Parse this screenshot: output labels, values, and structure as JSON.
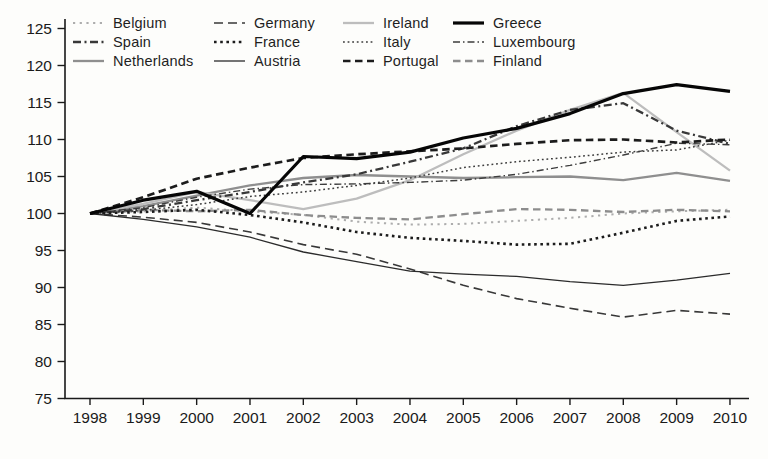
{
  "page": {
    "background": "#fdfdfb",
    "text_color": "#1a1a1a",
    "axis_color": "#1a1a1a"
  },
  "chart_data": {
    "type": "line",
    "title": "",
    "xlabel": "",
    "ylabel": "",
    "x": [
      1998,
      1999,
      2000,
      2001,
      2002,
      2003,
      2004,
      2005,
      2006,
      2007,
      2008,
      2009,
      2010
    ],
    "ylim": [
      75,
      125
    ],
    "yticks": [
      75,
      80,
      85,
      90,
      95,
      100,
      105,
      110,
      115,
      120,
      125
    ],
    "grid": false,
    "legend_position": "top-left inside plot, 4 columns x 3 rows",
    "index_note": "all series start at 100 in 1998",
    "series": [
      {
        "name": "Belgium",
        "color": "#adadad",
        "dasharray": "2.2 4.5",
        "width": 2.0,
        "values": [
          100,
          100.3,
          100.8,
          100.3,
          99.8,
          98.9,
          98.5,
          98.6,
          99.0,
          99.4,
          100.0,
          100.3,
          100.5
        ]
      },
      {
        "name": "Spain",
        "color": "#383838",
        "dasharray": "8 3.5 2 3.5",
        "width": 2.3,
        "values": [
          100,
          100.6,
          101.8,
          102.9,
          104.2,
          105.3,
          107.0,
          108.8,
          111.8,
          114.0,
          114.9,
          111.2,
          109.4
        ]
      },
      {
        "name": "Netherlands",
        "color": "#8f8f8f",
        "dasharray": "",
        "width": 2.3,
        "values": [
          100,
          101.0,
          102.4,
          103.8,
          104.8,
          105.2,
          105.0,
          104.8,
          104.9,
          105.0,
          104.5,
          105.5,
          104.4
        ]
      },
      {
        "name": "Germany",
        "color": "#383838",
        "dasharray": "9 5",
        "width": 1.6,
        "values": [
          100,
          99.5,
          98.8,
          97.5,
          95.8,
          94.5,
          92.5,
          90.3,
          88.5,
          87.2,
          86.0,
          86.9,
          86.4
        ]
      },
      {
        "name": "France",
        "color": "#1c1c1c",
        "dasharray": "2.6 3.6",
        "width": 2.6,
        "values": [
          100,
          100.2,
          100.5,
          99.8,
          98.8,
          97.5,
          96.7,
          96.3,
          95.8,
          95.9,
          97.4,
          99.0,
          99.6
        ]
      },
      {
        "name": "Austria",
        "color": "#2b2b2b",
        "dasharray": "",
        "width": 1.3,
        "values": [
          100,
          99.2,
          98.2,
          96.8,
          94.8,
          93.5,
          92.2,
          91.8,
          91.5,
          90.8,
          90.3,
          91.0,
          91.9
        ]
      },
      {
        "name": "Ireland",
        "color": "#bdbdbd",
        "dasharray": "",
        "width": 2.3,
        "values": [
          100,
          101.3,
          102.9,
          101.8,
          100.6,
          102.0,
          104.5,
          108.0,
          111.2,
          114.0,
          116.3,
          111.0,
          105.8
        ]
      },
      {
        "name": "Italy",
        "color": "#3d3d3d",
        "dasharray": "1.8 2.8",
        "width": 1.5,
        "values": [
          100,
          100.4,
          101.2,
          102.3,
          102.9,
          103.8,
          104.8,
          106.2,
          107.0,
          107.6,
          108.3,
          108.6,
          109.9
        ]
      },
      {
        "name": "Portugal",
        "color": "#1c1c1c",
        "dasharray": "7.5 4.5",
        "width": 2.7,
        "values": [
          100,
          102.2,
          104.7,
          106.2,
          107.5,
          108.0,
          108.4,
          108.8,
          109.4,
          109.9,
          110.0,
          109.6,
          110.0
        ]
      },
      {
        "name": "Greece",
        "color": "#060606",
        "dasharray": "",
        "width": 3.2,
        "values": [
          100,
          101.8,
          103.0,
          100.0,
          107.7,
          107.4,
          108.3,
          110.2,
          111.5,
          113.5,
          116.2,
          117.4,
          116.5
        ]
      },
      {
        "name": "Luxembourg",
        "color": "#3d3d3d",
        "dasharray": "7 3 1.5 3",
        "width": 1.4,
        "values": [
          100,
          100.8,
          102.2,
          103.3,
          103.9,
          104.0,
          104.2,
          104.5,
          105.3,
          106.5,
          107.9,
          109.5,
          109.3
        ]
      },
      {
        "name": "Finland",
        "color": "#8d8d8d",
        "dasharray": "7.5 4.5",
        "width": 2.3,
        "values": [
          100,
          100.5,
          100.3,
          100.5,
          99.8,
          99.4,
          99.2,
          99.9,
          100.6,
          100.5,
          100.2,
          100.5,
          100.3
        ]
      }
    ]
  }
}
